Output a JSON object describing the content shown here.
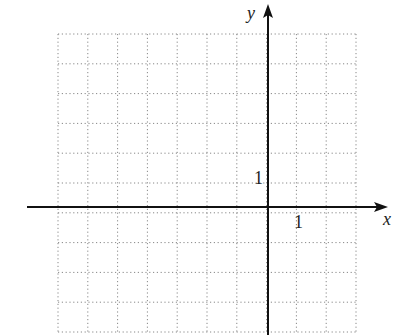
{
  "diagram": {
    "type": "coordinate-plane",
    "grid": {
      "columns": 10,
      "rows": 10,
      "x_range": [
        -7,
        3
      ],
      "y_range": [
        -4,
        6
      ],
      "line_style": "dotted",
      "line_color": "#888888"
    },
    "axes": {
      "x_label": "x",
      "y_label": "y",
      "color": "#111111"
    },
    "tick_labels": {
      "x_unit": "1",
      "y_unit": "1"
    }
  }
}
